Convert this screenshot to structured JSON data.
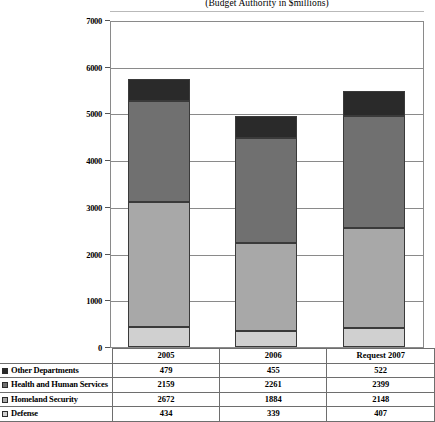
{
  "chart_data": {
    "type": "bar",
    "subtype": "stacked-column",
    "title": "",
    "subtitle": "(Budget Authority in $millions)",
    "xlabel": "",
    "ylabel": "",
    "ylim": [
      0,
      7000
    ],
    "ytick_step": 1000,
    "yticks": [
      0,
      1000,
      2000,
      3000,
      4000,
      5000,
      6000,
      7000
    ],
    "grid": true,
    "legend_position": "table-row-labels",
    "categories": [
      "2005",
      "2006",
      "Request 2007"
    ],
    "stack_order_bottom_to_top": [
      "Defense",
      "Homeland Security",
      "Health and Human Services",
      "Other Departments"
    ],
    "series": [
      {
        "name": "Other Departments",
        "values": [
          479,
          455,
          522
        ],
        "color": "#2a2a2a"
      },
      {
        "name": "Health and Human Services",
        "values": [
          2159,
          2261,
          2399
        ],
        "color": "#707070"
      },
      {
        "name": "Homeland Security",
        "values": [
          2672,
          1884,
          2148
        ],
        "color": "#a8a8a8"
      },
      {
        "name": "Defense",
        "values": [
          434,
          339,
          407
        ],
        "color": "#d0d0d0"
      }
    ],
    "totals": [
      5744,
      4939,
      5476
    ]
  },
  "table": {
    "header_row_label": "",
    "columns": [
      "2005",
      "2006",
      "Request 2007"
    ],
    "rows": [
      {
        "label": "Other Departments",
        "swatch": "#2a2a2a",
        "values": [
          "479",
          "455",
          "522"
        ]
      },
      {
        "label": "Health and Human Services",
        "swatch": "#707070",
        "values": [
          "2159",
          "2261",
          "2399"
        ]
      },
      {
        "label": "Homeland Security",
        "swatch": "#a8a8a8",
        "values": [
          "2672",
          "1884",
          "2148"
        ]
      },
      {
        "label": "Defense",
        "swatch": "#d0d0d0",
        "values": [
          "434",
          "339",
          "407"
        ]
      }
    ]
  },
  "axis": {
    "y_tick_labels": [
      "7000",
      "6000",
      "5000",
      "4000",
      "3000",
      "2000",
      "1000",
      "0"
    ]
  }
}
